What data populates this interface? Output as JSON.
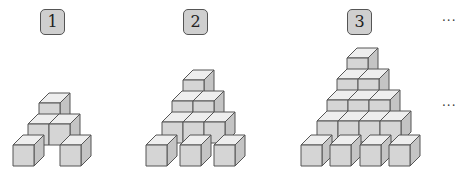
{
  "figures": [
    {
      "label": "1",
      "label_box": {
        "x": 40,
        "y": 9
      }
    },
    {
      "label": "2",
      "label_box": {
        "x": 183,
        "y": 9
      }
    },
    {
      "label": "3",
      "label_box": {
        "x": 347,
        "y": 9
      }
    }
  ],
  "continuation": {
    "top": "···",
    "middle": "···"
  },
  "colors": {
    "front": "#dadada",
    "top": "#eeeeee",
    "side": "#c4c4c4",
    "outline": "#555555",
    "label_bg": "#cfcfcf"
  },
  "cube": {
    "size": 21,
    "depth_dx": 10,
    "depth_dy": 10
  },
  "cubes": {
    "figure_1": [
      [
        13,
        145
      ],
      [
        60,
        145
      ],
      [
        28,
        124
      ],
      [
        49,
        124
      ],
      [
        39,
        103
      ]
    ],
    "figure_2": [
      [
        146,
        145
      ],
      [
        180,
        145
      ],
      [
        214,
        145
      ],
      [
        162,
        122
      ],
      [
        183,
        122
      ],
      [
        204,
        122
      ],
      [
        172,
        101
      ],
      [
        193,
        101
      ],
      [
        183,
        80
      ]
    ],
    "figure_3": [
      [
        301,
        145
      ],
      [
        330,
        145
      ],
      [
        360,
        145
      ],
      [
        389,
        145
      ],
      [
        317,
        121
      ],
      [
        338,
        121
      ],
      [
        359,
        121
      ],
      [
        380,
        121
      ],
      [
        327,
        100
      ],
      [
        348,
        100
      ],
      [
        369,
        100
      ],
      [
        337,
        79
      ],
      [
        358,
        79
      ],
      [
        347,
        58
      ]
    ]
  }
}
